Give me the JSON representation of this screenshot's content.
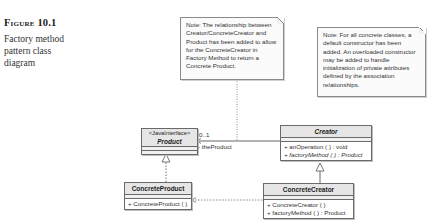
{
  "figure": {
    "label": "Figure 10.1",
    "caption": "Factory method pattern class diagram"
  },
  "notes": [
    {
      "text": "Note: The relationship between Creator/ConcreteCreator and Product has been added to allow for the ConcreteCreator in Factory Method to return a Concrete Product."
    },
    {
      "text": "Note: For all concrete classes, a default constructor has been added.  An overloaded constructor may be added to handle initialization of private attributes defined by the association relationships."
    }
  ],
  "classes": {
    "product": {
      "stereotype": "<JavaInterface>",
      "name": "Product"
    },
    "creator": {
      "name": "Creator",
      "ops": [
        "+ anOperation ( ) : void",
        "+ factoryMethod ( ) : Product"
      ]
    },
    "concrete_product": {
      "name": "ConcreteProduct",
      "ops": [
        "+ ConcreteProduct ( )"
      ]
    },
    "concrete_creator": {
      "name": "ConcreteCreator",
      "ops": [
        "+ ConcreteCreator ( )",
        "+ factoryMethod ( ) : Product"
      ]
    }
  },
  "association": {
    "multiplicity": "0..1",
    "role": "- theProduct"
  }
}
